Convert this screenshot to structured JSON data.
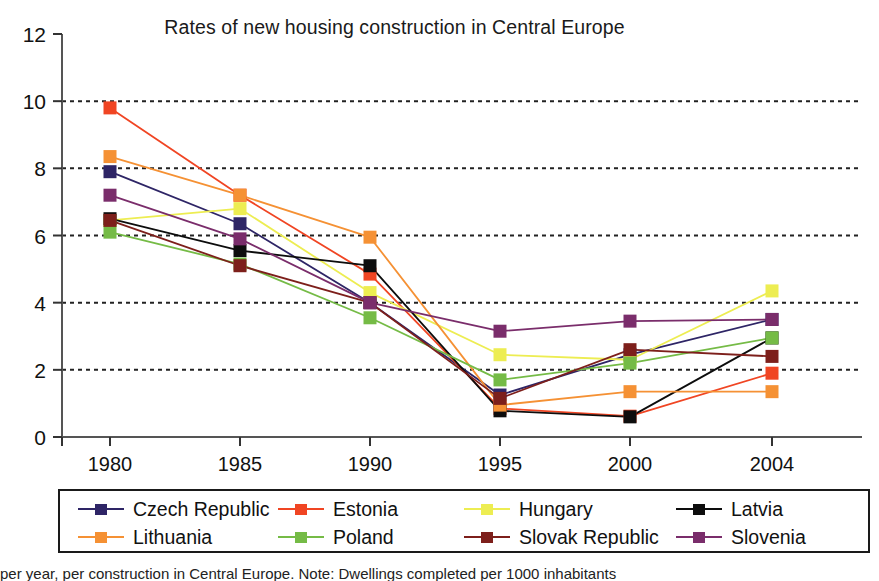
{
  "chart_data": {
    "type": "line",
    "title": "Rates of new housing construction in Central Europe",
    "xlabel": "",
    "ylabel": "",
    "categories": [
      "1980",
      "1985",
      "1990",
      "1995",
      "2000",
      "2004"
    ],
    "x": [
      1980,
      1985,
      1990,
      1995,
      2000,
      2004
    ],
    "xlim": [
      1980,
      2004
    ],
    "ylim": [
      0,
      12
    ],
    "yticks": [
      0,
      2,
      4,
      6,
      8,
      10,
      12
    ],
    "xticks": [
      "1980",
      "1985",
      "1990",
      "1995",
      "2000",
      "2004"
    ],
    "grid": "horizontal-dotted",
    "legend_position": "bottom-boxed",
    "marker": "square",
    "series": [
      {
        "name": "Czech Republic",
        "color": "#2e2566",
        "values": [
          7.9,
          6.35,
          4.0,
          1.25,
          2.45,
          3.5
        ]
      },
      {
        "name": "Estonia",
        "color": "#f04523",
        "values": [
          9.8,
          7.2,
          4.85,
          0.85,
          0.62,
          1.9
        ]
      },
      {
        "name": "Hungary",
        "color": "#eded52",
        "values": [
          6.45,
          6.8,
          4.3,
          2.45,
          2.3,
          4.35
        ]
      },
      {
        "name": "Latvia",
        "color": "#0d0d0d",
        "values": [
          6.5,
          5.55,
          5.1,
          0.78,
          0.6,
          2.95
        ]
      },
      {
        "name": "Lithuania",
        "color": "#f59134",
        "values": [
          8.35,
          7.2,
          5.95,
          0.95,
          1.35,
          1.35
        ]
      },
      {
        "name": "Poland",
        "color": "#75bb46",
        "values": [
          6.1,
          5.15,
          3.55,
          1.7,
          2.2,
          2.95
        ]
      },
      {
        "name": "Slovak Republic",
        "color": "#7d1f1b",
        "values": [
          6.45,
          5.1,
          4.0,
          1.15,
          2.6,
          2.4
        ]
      },
      {
        "name": "Slovenia",
        "color": "#7a2d6b",
        "values": [
          7.2,
          5.9,
          4.0,
          3.15,
          3.45,
          3.5
        ]
      }
    ]
  },
  "legend": {
    "rows": [
      [
        {
          "label": "Czech Republic",
          "color": "#2e2566"
        },
        {
          "label": "Estonia",
          "color": "#f04523"
        },
        {
          "label": "Hungary",
          "color": "#eded52"
        },
        {
          "label": "Latvia",
          "color": "#0d0d0d"
        }
      ],
      [
        {
          "label": "Lithuania",
          "color": "#f59134"
        },
        {
          "label": "Poland",
          "color": "#75bb46"
        },
        {
          "label": "Slovak Republic",
          "color": "#7d1f1b"
        },
        {
          "label": "Slovenia",
          "color": "#7a2d6b"
        }
      ]
    ]
  },
  "caption": {
    "text": "per year, per construction in Central Europe. Note: Dwellings completed per 1000 inhabitants"
  }
}
